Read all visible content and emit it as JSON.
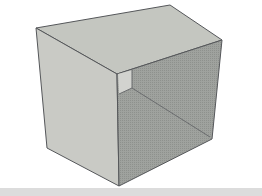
{
  "image": {
    "subject": "3D rendered open box (hollow cube) in gray",
    "colors": {
      "background": "#ffffff",
      "top_face": "#c4c6c0",
      "left_face": "#c9cac5",
      "right_face": "#9a9d99",
      "inner_face": "#d2d3cf",
      "edge": "#55575a",
      "floor_band": "#dcdcdc"
    },
    "vertices": {
      "top_back_left": [
        36,
        28
      ],
      "top_back_right": [
        170,
        5
      ],
      "top_right": [
        222,
        40
      ],
      "top_front": [
        117,
        74
      ],
      "bottom_left": [
        47,
        148
      ],
      "bottom_front": [
        119,
        186
      ],
      "bottom_right": [
        212,
        139
      ],
      "inner_top": [
        132,
        70
      ],
      "inner_corner": [
        132,
        88
      ]
    }
  }
}
